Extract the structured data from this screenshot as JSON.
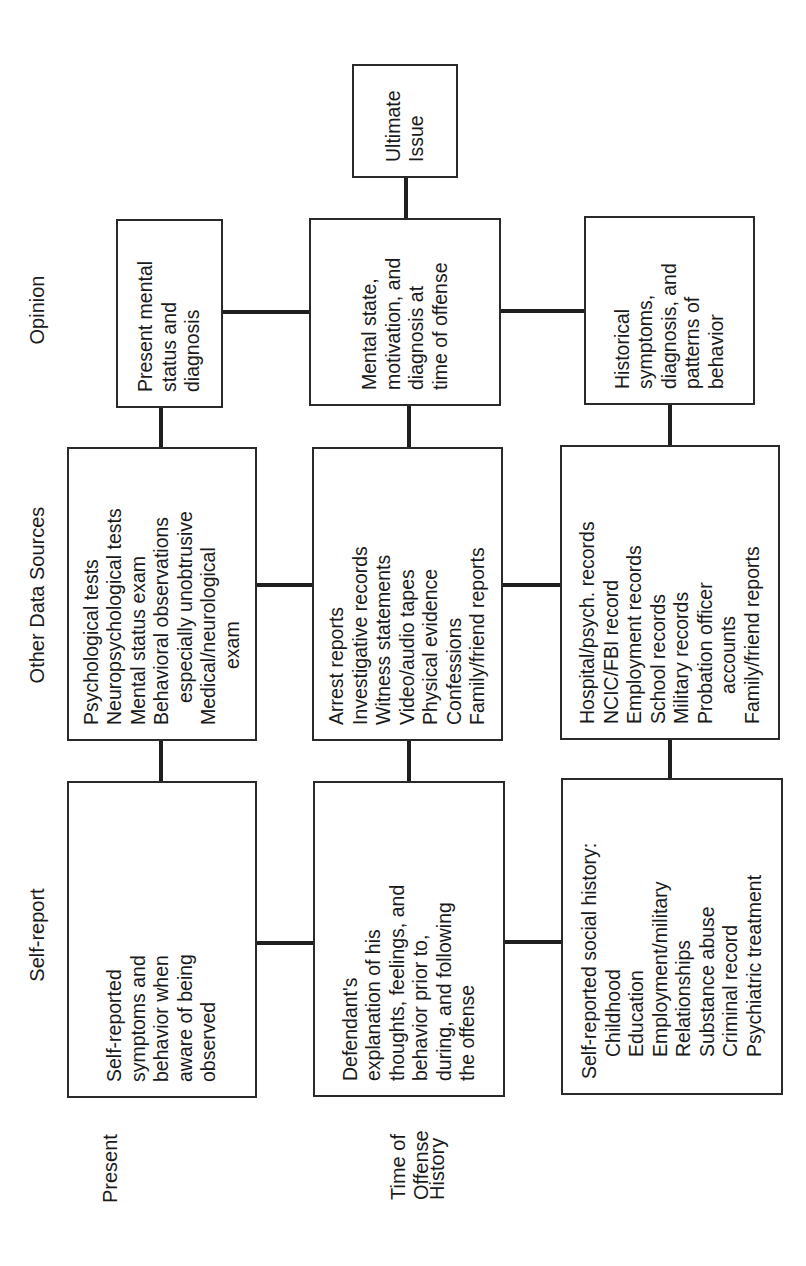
{
  "columns": {
    "self_report": "Self-report",
    "other_data_sources": "Other Data Sources",
    "opinion": "Opinion"
  },
  "rows": {
    "present": [
      "Present"
    ],
    "time_of_offense": [
      "Time of",
      "Offense"
    ],
    "history": [
      "History"
    ]
  },
  "self_report": {
    "present": [
      "Self-reported",
      "symptoms and",
      "behavior when",
      "aware of being",
      "observed"
    ],
    "time_of_offense": [
      "Defendant's",
      "explanation of his",
      "thoughts, feelings, and",
      "behavior prior to,",
      "during, and following",
      "the offense"
    ],
    "history": {
      "heading": "Self-reported social history:",
      "items": [
        "Childhood",
        "Education",
        "Employment/military",
        "Relationships",
        "Substance abuse",
        "Criminal record",
        "Psychiatric treatment"
      ]
    }
  },
  "other_data_sources": {
    "present": [
      {
        "text": "Psychological tests",
        "indent": false
      },
      {
        "text": "Neuropsychological tests",
        "indent": false
      },
      {
        "text": "Mental status exam",
        "indent": false
      },
      {
        "text": "Behavioral observations",
        "indent": false
      },
      {
        "text": "especially unobtrusive",
        "indent": true
      },
      {
        "text": "Medical/neurological",
        "indent": false
      },
      {
        "text": "exam",
        "indent": true
      }
    ],
    "time_of_offense": [
      {
        "text": "Arrest reports",
        "indent": false
      },
      {
        "text": "Investigative records",
        "indent": false
      },
      {
        "text": "Witness statements",
        "indent": false
      },
      {
        "text": "Video/audio tapes",
        "indent": false
      },
      {
        "text": "Physical evidence",
        "indent": false
      },
      {
        "text": "Confessions",
        "indent": false
      },
      {
        "text": "Family/friend reports",
        "indent": false
      }
    ],
    "history": [
      {
        "text": "Hospital/psych. records",
        "indent": false
      },
      {
        "text": "NCIC/FBI record",
        "indent": false
      },
      {
        "text": "Employment records",
        "indent": false
      },
      {
        "text": "School records",
        "indent": false
      },
      {
        "text": "Military records",
        "indent": false
      },
      {
        "text": "Probation officer",
        "indent": false
      },
      {
        "text": "accounts",
        "indent": true
      },
      {
        "text": "Family/friend reports",
        "indent": false
      }
    ]
  },
  "opinion": {
    "present": [
      "Present mental",
      "status and",
      "diagnosis"
    ],
    "time_of_offense": [
      "Mental state,",
      "motivation, and",
      "diagnosis at",
      "time of offense"
    ],
    "history": [
      "Historical",
      "symptoms,",
      "diagnosis, and",
      "patterns of",
      "behavior"
    ]
  },
  "ultimate_issue": [
    "Ultimate",
    "Issue"
  ],
  "colors": {
    "line": "#1f1f1f",
    "text": "#1a1a1a",
    "background": "#ffffff"
  }
}
